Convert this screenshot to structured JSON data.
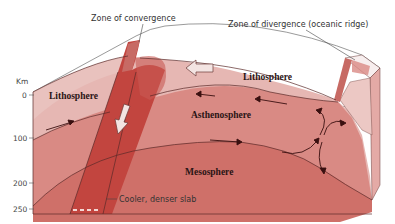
{
  "diagram": {
    "labels": {
      "convergence": "Zone of convergence",
      "divergence": "Zone of divergence (oceanic ridge)",
      "lithosphere_left": "Lithosphere",
      "lithosphere_right": "Lithosphere",
      "asthenosphere": "Asthenosphere",
      "mesosphere": "Mesosphere",
      "slab": "Cooler, denser slab"
    },
    "depth_axis": {
      "unit": "Km",
      "ticks": [
        "0",
        "100",
        "200",
        "250"
      ]
    },
    "colors": {
      "top_surface": "#ffffff",
      "lithosphere": "#e6b7b3",
      "asthenosphere": "#d98a84",
      "mesosphere": "#cf7069",
      "slab": "#c2453f",
      "outline": "#5a2a28",
      "arrow": "#3a1010"
    }
  }
}
